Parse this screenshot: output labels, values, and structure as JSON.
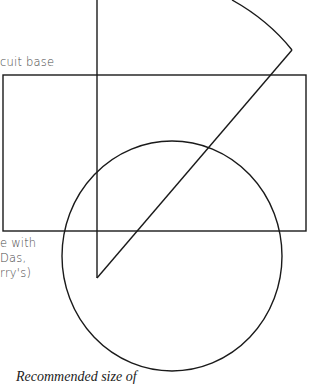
{
  "labels": {
    "biscuit_base": "cuit base",
    "note_lines": [
      "e with",
      "Das,",
      "rry's)"
    ],
    "caption": "Recommended size of"
  },
  "shapes": {
    "stroke_color": "#1a1a1a",
    "rectangle": {
      "x": 3,
      "y": 75,
      "width": 303,
      "height": 156
    },
    "vertical_line": {
      "x": 97,
      "y1": 0,
      "y2": 278
    },
    "wedge_diagonal": {
      "x1": 97,
      "y1": 278,
      "x2": 292,
      "y2": 50
    },
    "wedge_arc": {
      "x1": 232,
      "y1": 0,
      "x2": 292,
      "y2": 50
    },
    "circle": {
      "cx": 172,
      "cy": 256,
      "rx": 110,
      "ry": 115
    }
  }
}
